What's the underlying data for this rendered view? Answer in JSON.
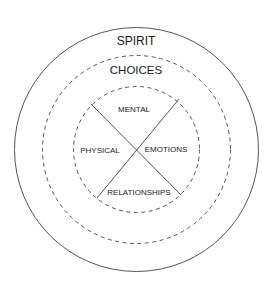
{
  "diagram": {
    "outer_label": "SPIRIT",
    "middle_label": "CHOICES",
    "quadrants": {
      "top": "MENTAL",
      "left": "PHYSICAL",
      "right": "EMOTIONS",
      "bottom": "RELATIONSHIPS"
    },
    "colors": {
      "stroke": "#555555",
      "text": "#1a1a1a",
      "background": "#ffffff"
    }
  }
}
